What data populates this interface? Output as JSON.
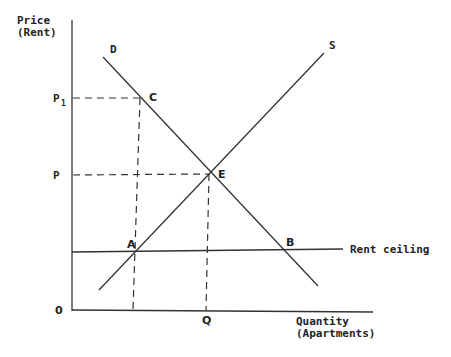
{
  "diagram": {
    "axes": {
      "y_label_line1": "Price",
      "y_label_line2": "(Rent)",
      "x_label_line1": "Quantity",
      "x_label_line2": "(Apartments)",
      "origin": "0"
    },
    "price_ticks": {
      "p1_base": "P",
      "p1_sub": "1",
      "p": "P"
    },
    "quantity_ticks": {
      "q": "Q"
    },
    "curves": {
      "demand": "D",
      "supply": "S",
      "rent_ceiling": "Rent ceiling"
    },
    "points": {
      "a": "A",
      "b": "B",
      "c": "C",
      "e": "E"
    }
  }
}
